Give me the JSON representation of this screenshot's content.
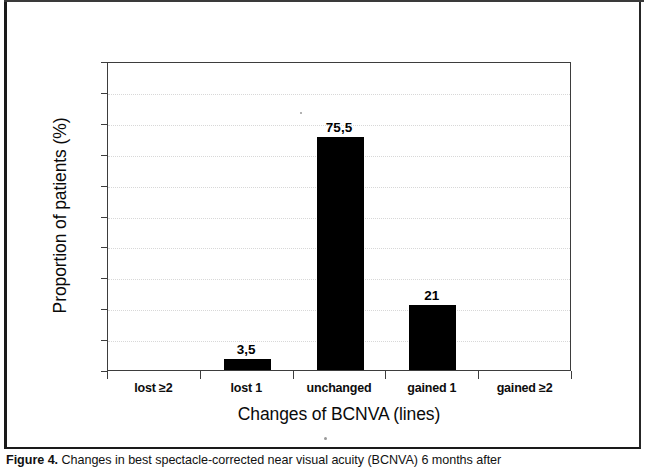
{
  "chart_data": {
    "type": "bar",
    "title": "",
    "xlabel": "Changes of BCNVA (lines)",
    "ylabel": "Proportion of patients (%)",
    "categories": [
      "lost ≥2",
      "lost 1",
      "unchanged",
      "gained 1",
      "gained ≥2"
    ],
    "values": [
      0,
      3.5,
      75.5,
      21,
      0
    ],
    "value_labels": [
      "",
      "3,5",
      "75,5",
      "21",
      ""
    ],
    "ylim": [
      0,
      100
    ],
    "yticks": [
      0,
      10,
      20,
      30,
      40,
      50,
      60,
      70,
      80,
      90,
      100
    ],
    "ytick_labels": [
      "0",
      "10",
      "20",
      "30",
      "40",
      "50",
      "60",
      "70",
      "80",
      "90",
      "100"
    ],
    "grid": true,
    "grid_axis": "y",
    "legend": false,
    "bar_color": "#000000",
    "decimal_separator": ","
  },
  "figure": {
    "caption_label": "Figure 4.",
    "caption_text": " Changes in best spectacle-corrected near visual acuity (BCNVA) 6 months after"
  }
}
